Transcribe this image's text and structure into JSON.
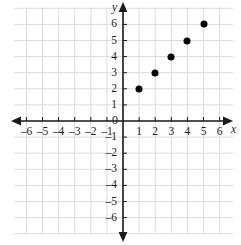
{
  "chart_data": {
    "type": "scatter",
    "title": "",
    "xlabel": "x",
    "ylabel": "y",
    "xlim": [
      -6.8,
      6.8
    ],
    "ylim": [
      -6.8,
      6.8
    ],
    "grid": true,
    "legend": null,
    "x": [
      1,
      2,
      3,
      4,
      5
    ],
    "values": [
      2,
      3,
      4,
      5,
      6
    ],
    "points": [
      {
        "x": 1,
        "y": 2
      },
      {
        "x": 2,
        "y": 3
      },
      {
        "x": 3,
        "y": 4
      },
      {
        "x": 4,
        "y": 5
      },
      {
        "x": 5,
        "y": 6
      }
    ],
    "x_ticks": [
      -6,
      -5,
      -4,
      -3,
      -2,
      -1,
      1,
      2,
      3,
      4,
      5,
      6
    ],
    "y_ticks": [
      6,
      5,
      4,
      3,
      2,
      1,
      -1,
      -2,
      -3,
      -4,
      -5,
      -6
    ],
    "x_tick_labels": [
      "–6",
      "–5",
      "–4",
      "–3",
      "–2",
      "–1",
      "1",
      "2",
      "3",
      "4",
      "5",
      "6"
    ],
    "y_tick_labels": [
      "6",
      "5",
      "4",
      "3",
      "2",
      "1",
      "–1",
      "–2",
      "–3",
      "–4",
      "–5",
      "–6"
    ],
    "origin_label": "0",
    "colors": {
      "point": "#000000",
      "axis": "#1a1a1a",
      "grid": "#dcdcdc",
      "background": "#ffffff",
      "text": "#1a1a1a"
    }
  },
  "axes": {
    "x_axis_name": "x",
    "y_axis_name": "y"
  }
}
